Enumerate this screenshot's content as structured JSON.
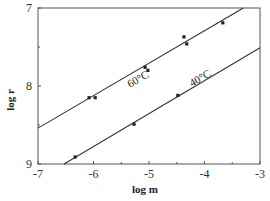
{
  "chart_data": {
    "type": "scatter",
    "title": "",
    "xlabel": "log m",
    "ylabel": "log r",
    "xlim": [
      -7,
      -3
    ],
    "ylim": [
      7,
      9
    ],
    "y_inverted": true,
    "grid": false,
    "x_ticks": [
      "-7",
      "-6",
      "-5",
      "-4",
      "-3"
    ],
    "y_ticks": [
      "7",
      "8",
      "9"
    ],
    "series": [
      {
        "name": "60°C",
        "points": [
          [
            -6.08,
            8.15
          ],
          [
            -5.97,
            8.15
          ],
          [
            -5.07,
            7.76
          ],
          [
            -5.02,
            7.8
          ],
          [
            -4.37,
            7.37
          ],
          [
            -4.32,
            7.46
          ],
          [
            -3.67,
            7.19
          ]
        ],
        "fit_line": [
          [
            -7,
            8.54
          ],
          [
            -3.3,
            7.0
          ]
        ]
      },
      {
        "name": "40°C",
        "points": [
          [
            -6.33,
            8.91
          ],
          [
            -5.27,
            8.49
          ],
          [
            -4.48,
            8.12
          ]
        ],
        "fit_line": [
          [
            -6.53,
            9.0
          ],
          [
            -3,
            7.51
          ]
        ]
      }
    ],
    "annotations": [
      "60°C",
      "40°C"
    ]
  }
}
